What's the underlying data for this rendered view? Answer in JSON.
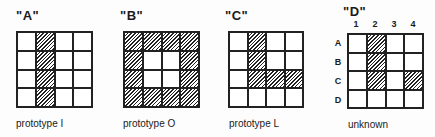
{
  "figure": {
    "panels": [
      {
        "title": "\"A\"",
        "caption": "prototype I",
        "cells": [
          [
            0,
            1,
            0,
            0
          ],
          [
            0,
            1,
            0,
            0
          ],
          [
            0,
            1,
            0,
            0
          ],
          [
            0,
            1,
            0,
            0
          ]
        ]
      },
      {
        "title": "\"B\"",
        "caption": "prototype O",
        "cells": [
          [
            1,
            1,
            1,
            1
          ],
          [
            1,
            0,
            0,
            1
          ],
          [
            1,
            0,
            0,
            1
          ],
          [
            1,
            1,
            1,
            1
          ]
        ]
      },
      {
        "title": "\"C\"",
        "caption": "prototype L",
        "cells": [
          [
            0,
            1,
            0,
            0
          ],
          [
            0,
            1,
            0,
            0
          ],
          [
            0,
            1,
            1,
            1
          ],
          [
            0,
            0,
            0,
            0
          ]
        ]
      },
      {
        "title": "\"D\"",
        "caption": "unknown",
        "column_labels": [
          "1",
          "2",
          "3",
          "4"
        ],
        "row_labels": [
          "A",
          "B",
          "C",
          "D"
        ],
        "cells": [
          [
            0,
            1,
            0,
            0
          ],
          [
            0,
            1,
            0,
            0
          ],
          [
            0,
            1,
            0,
            1
          ],
          [
            0,
            0,
            0,
            0
          ]
        ]
      }
    ],
    "colors": {
      "ink": "#222222",
      "background": "#fdfdfd"
    }
  }
}
